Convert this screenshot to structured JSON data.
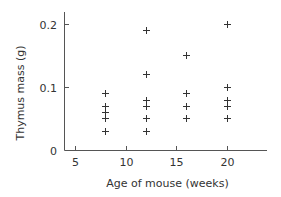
{
  "chart_data": {
    "type": "scatter",
    "title": "",
    "xlabel": "Age of mouse (weeks)",
    "ylabel": "Thymus mass (g)",
    "xlim": [
      3.9,
      24
    ],
    "ylim": [
      0,
      0.219
    ],
    "xticks": [
      5,
      10,
      15,
      20
    ],
    "xtick_labels": [
      "5",
      "10",
      "15",
      "20"
    ],
    "yticks": [
      0,
      0.1,
      0.2
    ],
    "ytick_labels": [
      "0",
      "0.1",
      "0.2"
    ],
    "grid": false,
    "marker": "plus",
    "series": [
      {
        "name": "Thymus mass",
        "points": [
          {
            "x": 8,
            "y": 0.09
          },
          {
            "x": 8,
            "y": 0.07
          },
          {
            "x": 8,
            "y": 0.06
          },
          {
            "x": 8,
            "y": 0.05
          },
          {
            "x": 8,
            "y": 0.03
          },
          {
            "x": 12,
            "y": 0.19
          },
          {
            "x": 12,
            "y": 0.12
          },
          {
            "x": 12,
            "y": 0.08
          },
          {
            "x": 12,
            "y": 0.07
          },
          {
            "x": 12,
            "y": 0.05
          },
          {
            "x": 12,
            "y": 0.03
          },
          {
            "x": 16,
            "y": 0.15
          },
          {
            "x": 16,
            "y": 0.09
          },
          {
            "x": 16,
            "y": 0.07
          },
          {
            "x": 16,
            "y": 0.05
          },
          {
            "x": 20,
            "y": 0.2
          },
          {
            "x": 20,
            "y": 0.1
          },
          {
            "x": 20,
            "y": 0.08
          },
          {
            "x": 20,
            "y": 0.07
          },
          {
            "x": 20,
            "y": 0.05
          }
        ]
      }
    ]
  }
}
